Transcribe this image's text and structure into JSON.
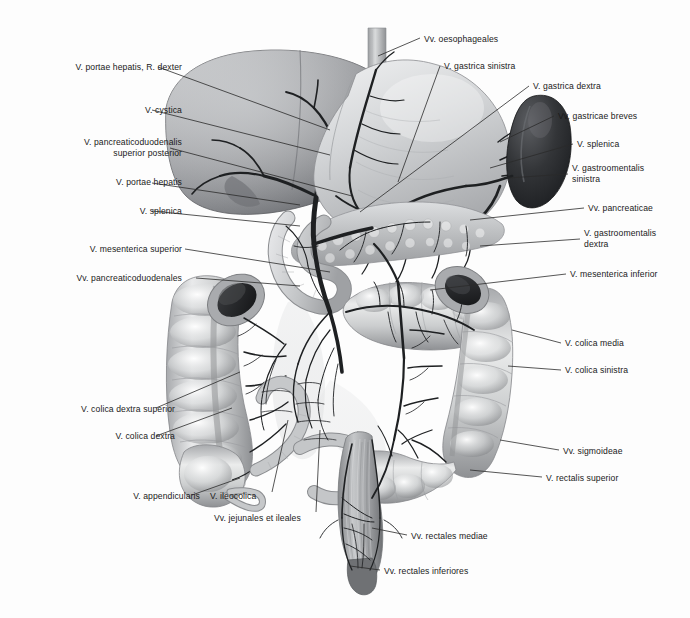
{
  "figure": {
    "type": "anatomical-illustration",
    "style": "grayscale airbrush medical illustration",
    "background_color": "#fdfdfd",
    "text_color": "#1a1a1a",
    "leader_line_color": "#2b2b2b"
  },
  "labels_left": [
    {
      "id": "v-portae-hepatis-r-dexter",
      "text": "V. portae hepatis, R. dexter",
      "x": 30,
      "y": 62,
      "align": "right",
      "anchor_x": 152,
      "leader": [
        [
          158,
          67
        ],
        [
          330,
          130
        ]
      ]
    },
    {
      "id": "v-cystica",
      "text": "V. cystica",
      "x": 83,
      "y": 105,
      "align": "right",
      "anchor_x": 99,
      "leader": [
        [
          152,
          110
        ],
        [
          330,
          155
        ]
      ]
    },
    {
      "id": "v-pancreaticoduodenalis-superior-posterior",
      "text": "V. pancreaticoduodenalis\nsuperior posterior",
      "x": 18,
      "y": 137,
      "align": "right",
      "anchor_x": 164,
      "leader": [
        [
          170,
          148
        ],
        [
          352,
          196
        ]
      ]
    },
    {
      "id": "v-portae-hepatis",
      "text": "V. portae hepatis",
      "x": 55,
      "y": 177,
      "align": "right",
      "anchor_x": 127,
      "leader": [
        [
          152,
          183
        ],
        [
          300,
          205
        ]
      ]
    },
    {
      "id": "v-splenica-left",
      "text": "V. splenica",
      "x": 83,
      "y": 206,
      "align": "right",
      "anchor_x": 99,
      "leader": [
        [
          152,
          211
        ],
        [
          300,
          226
        ]
      ]
    },
    {
      "id": "v-mesenterica-superior",
      "text": "V. mesenterica superior",
      "x": 43,
      "y": 244,
      "align": "right",
      "anchor_x": 139,
      "leader": [
        [
          185,
          249
        ],
        [
          330,
          272
        ]
      ]
    },
    {
      "id": "vv-pancreaticoduodenales",
      "text": "Vv. pancreaticoduodenales",
      "x": 32,
      "y": 273,
      "align": "right",
      "anchor_x": 150,
      "leader": [
        [
          196,
          278
        ],
        [
          300,
          286
        ]
      ]
    },
    {
      "id": "v-colica-dextra-superior",
      "text": "V. colica dextra superior",
      "x": 32,
      "y": 404,
      "align": "right",
      "anchor_x": 143,
      "leader": [
        [
          156,
          408
        ],
        [
          240,
          372
        ]
      ]
    },
    {
      "id": "v-colica-dextra",
      "text": "V. colica dextra",
      "x": 75,
      "y": 431,
      "align": "right",
      "anchor_x": 100,
      "leader": [
        [
          156,
          436
        ],
        [
          232,
          408
        ]
      ]
    },
    {
      "id": "v-appendicularis",
      "text": "V. appendicularis",
      "x": 104,
      "y": 491,
      "align": "right",
      "anchor_x": 96,
      "leader": [
        [
          192,
          495
        ],
        [
          240,
          478
        ]
      ]
    },
    {
      "id": "v-ileocolica",
      "text": "V. ileocolica",
      "x": 210,
      "y": 491,
      "align": "left",
      "anchor_x": 62,
      "leader": [
        [
          272,
          492
        ],
        [
          288,
          420
        ]
      ]
    },
    {
      "id": "vv-jejunales-et-ileales",
      "text": "Vv. jejunales et ileales",
      "x": 214,
      "y": 513,
      "align": "left",
      "anchor_x": 106,
      "leader": [
        [
          316,
          512
        ],
        [
          320,
          430
        ]
      ]
    }
  ],
  "labels_top": [
    {
      "id": "vv-oesophageales",
      "text": "Vv. oesophageales",
      "x": 424,
      "y": 34,
      "align": "left",
      "anchor_x": 92,
      "leader": [
        [
          420,
          38
        ],
        [
          378,
          56
        ]
      ]
    },
    {
      "id": "v-gastrica-sinistra",
      "text": "V. gastrica sinistra",
      "x": 444,
      "y": 61,
      "align": "left",
      "anchor_x": 90,
      "leader": [
        [
          440,
          66
        ],
        [
          398,
          182
        ]
      ]
    },
    {
      "id": "v-gastrica-dextra",
      "text": "V. gastrica dextra",
      "x": 533,
      "y": 81,
      "align": "left",
      "anchor_x": 86,
      "leader": [
        [
          529,
          86
        ],
        [
          360,
          212
        ]
      ]
    }
  ],
  "labels_right": [
    {
      "id": "vv-gastricae-breves",
      "text": "Vv. gastricae breves",
      "x": 558,
      "y": 111,
      "align": "left",
      "anchor_x": 98,
      "leader": [
        [
          554,
          116
        ],
        [
          500,
          142
        ]
      ]
    },
    {
      "id": "v-splenica-right",
      "text": "V. splenica",
      "x": 577,
      "y": 139,
      "align": "left",
      "anchor_x": 54,
      "leader": [
        [
          573,
          144
        ],
        [
          490,
          168
        ]
      ]
    },
    {
      "id": "v-gastroomentalis-sinistra",
      "text": "V. gastroomentalis\nsinistra",
      "x": 572,
      "y": 163,
      "align": "left",
      "anchor_x": 82,
      "leader": [
        [
          568,
          174
        ],
        [
          508,
          178
        ]
      ]
    },
    {
      "id": "vv-pancreaticae",
      "text": "Vv. pancreaticae",
      "x": 588,
      "y": 203,
      "align": "left",
      "anchor_x": 80,
      "leader": [
        [
          584,
          208
        ],
        [
          470,
          220
        ]
      ]
    },
    {
      "id": "v-gastroomentalis-dextra",
      "text": "V. gastroomentalis\ndextra",
      "x": 584,
      "y": 228,
      "align": "left",
      "anchor_x": 82,
      "leader": [
        [
          580,
          239
        ],
        [
          480,
          246
        ]
      ]
    },
    {
      "id": "v-mesenterica-inferior",
      "text": "V. mesenterica inferior",
      "x": 570,
      "y": 269,
      "align": "left",
      "anchor_x": 104,
      "leader": [
        [
          566,
          274
        ],
        [
          430,
          290
        ]
      ]
    },
    {
      "id": "v-colica-media",
      "text": "V. colica media",
      "x": 565,
      "y": 338,
      "align": "left",
      "anchor_x": 72,
      "leader": [
        [
          561,
          343
        ],
        [
          512,
          330
        ]
      ]
    },
    {
      "id": "v-colica-sinistra",
      "text": "V. colica sinistra",
      "x": 565,
      "y": 365,
      "align": "left",
      "anchor_x": 76,
      "leader": [
        [
          561,
          370
        ],
        [
          508,
          366
        ]
      ]
    },
    {
      "id": "vv-sigmoideae",
      "text": "Vv. sigmoideae",
      "x": 563,
      "y": 446,
      "align": "left",
      "anchor_x": 72,
      "leader": [
        [
          559,
          450
        ],
        [
          500,
          440
        ]
      ]
    },
    {
      "id": "v-rectalis-superior",
      "text": "V. rectalis superior",
      "x": 546,
      "y": 473,
      "align": "left",
      "anchor_x": 88,
      "leader": [
        [
          542,
          477
        ],
        [
          470,
          470
        ]
      ]
    }
  ],
  "labels_bottom": [
    {
      "id": "vv-rectales-mediae",
      "text": "Vv. rectales mediae",
      "x": 411,
      "y": 531,
      "align": "left",
      "anchor_x": 94,
      "leader": [
        [
          407,
          535
        ],
        [
          372,
          528
        ]
      ]
    },
    {
      "id": "vv-rectales-inferiores",
      "text": "Vv. rectales inferiores",
      "x": 384,
      "y": 566,
      "align": "left",
      "anchor_x": 102,
      "leader": [
        [
          380,
          570
        ],
        [
          350,
          566
        ]
      ]
    }
  ],
  "organs": [
    {
      "id": "liver",
      "name": "Liver (Hepar)",
      "tone": "#8e9094"
    },
    {
      "id": "stomach",
      "name": "Stomach (Gaster)",
      "tone": "#c9cbcd"
    },
    {
      "id": "spleen",
      "name": "Spleen (Splen)",
      "tone": "#2f3134"
    },
    {
      "id": "pancreas",
      "name": "Pancreas",
      "tone": "#b6b8ba"
    },
    {
      "id": "duodenum",
      "name": "Duodenum",
      "tone": "#c2c4c6"
    },
    {
      "id": "ascending-colon",
      "name": "Colon ascendens",
      "tone": "#cfd1d3"
    },
    {
      "id": "transverse-colon",
      "name": "Colon transversum",
      "tone": "#cfd1d3"
    },
    {
      "id": "descending-colon",
      "name": "Colon descendens",
      "tone": "#cfd1d3"
    },
    {
      "id": "sigmoid-colon",
      "name": "Colon sigmoideum",
      "tone": "#c7c9cb"
    },
    {
      "id": "rectum",
      "name": "Rectum",
      "tone": "#9a9c9f"
    },
    {
      "id": "small-intestine",
      "name": "Jejunum et ileum",
      "tone": "#bdbfc1"
    },
    {
      "id": "oesophagus",
      "name": "Oesophagus",
      "tone": "#b9bbbd"
    },
    {
      "id": "caecum",
      "name": "Caecum",
      "tone": "#cdcfd1"
    },
    {
      "id": "appendix",
      "name": "Appendix vermiformis",
      "tone": "#c4c6c8"
    }
  ]
}
